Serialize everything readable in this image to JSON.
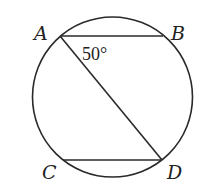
{
  "diagram": {
    "type": "circle-geometry",
    "circle": {
      "cx": 112.5,
      "cy": 97,
      "r": 80
    },
    "points": {
      "A": {
        "label": "A",
        "x": 60,
        "y": 36
      },
      "B": {
        "label": "B",
        "x": 163,
        "y": 36
      },
      "C": {
        "label": "C",
        "x": 63,
        "y": 160
      },
      "D": {
        "label": "D",
        "x": 162,
        "y": 160
      }
    },
    "segments": [
      {
        "name": "AB",
        "from": "A",
        "to": "B",
        "style": "solid"
      },
      {
        "name": "AD",
        "from": "A",
        "to": "D",
        "style": "solid"
      },
      {
        "name": "CD",
        "from": "C",
        "to": "D",
        "style": "solid"
      }
    ],
    "angle": {
      "vertex": "A",
      "between": [
        "B",
        "D"
      ],
      "label": "50°"
    },
    "labels": {
      "A": "A",
      "B": "B",
      "C": "C",
      "D": "D",
      "angle_BAD": "50°"
    }
  }
}
